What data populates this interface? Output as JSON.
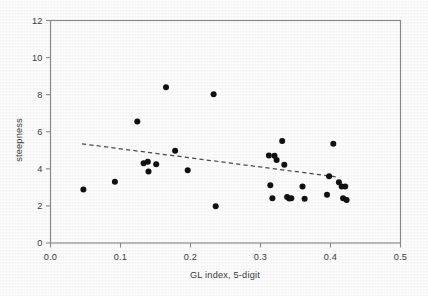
{
  "figure": {
    "background_color": "#fefefe",
    "marker_color": "#111111",
    "axis_color": "#8a8a8a",
    "trend_color": "#4a4a4a"
  },
  "chart_data": {
    "type": "scatter",
    "title": "",
    "subtitle": "",
    "xlabel": "GL index, 5-digit",
    "ylabel": "steepness",
    "xlim": [
      0.0,
      0.5
    ],
    "ylim": [
      0,
      12
    ],
    "xticks": [
      0.0,
      0.1,
      0.2,
      0.3,
      0.4,
      0.5
    ],
    "xticklabels": [
      "0.0",
      "0.1",
      "0.2",
      "0.3",
      "0.4",
      "0.5"
    ],
    "yticks": [
      0,
      2,
      4,
      6,
      8,
      10,
      12
    ],
    "yticklabels": [
      "0",
      "2",
      "4",
      "6",
      "8",
      "10",
      "12"
    ],
    "grid": false,
    "legend": null,
    "legend_position": "none",
    "frame": "full-box",
    "series": [
      {
        "name": "observations",
        "marker": "filled-circle",
        "marker_color": "#111111",
        "marker_size": 6,
        "x": [
          0.047,
          0.092,
          0.124,
          0.133,
          0.139,
          0.14,
          0.151,
          0.165,
          0.178,
          0.196,
          0.233,
          0.236,
          0.312,
          0.314,
          0.317,
          0.32,
          0.323,
          0.331,
          0.334,
          0.338,
          0.341,
          0.344,
          0.36,
          0.363,
          0.395,
          0.398,
          0.404,
          0.412,
          0.416,
          0.418,
          0.421,
          0.423
        ],
        "y": [
          2.88,
          3.31,
          6.55,
          4.3,
          4.38,
          3.86,
          4.25,
          8.4,
          4.98,
          3.92,
          8.02,
          1.98,
          4.72,
          3.12,
          2.42,
          4.7,
          4.48,
          5.5,
          4.22,
          2.48,
          2.4,
          2.42,
          3.05,
          2.38,
          2.6,
          3.6,
          5.35,
          3.28,
          3.05,
          2.42,
          3.05,
          2.32
        ]
      }
    ],
    "trendline": {
      "style": "dashed",
      "color": "#4a4a4a",
      "x": [
        0.045,
        0.412
      ],
      "y": [
        5.35,
        3.55
      ]
    }
  }
}
